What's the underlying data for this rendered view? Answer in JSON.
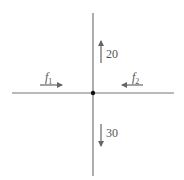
{
  "diagram": {
    "colors": {
      "line": "#777777",
      "arrow": "#666666",
      "dot": "#111111",
      "text": "#555555"
    },
    "forces": {
      "up": {
        "label": "20",
        "direction": "up"
      },
      "down": {
        "label": "30",
        "direction": "down"
      },
      "left_force": {
        "label": "f",
        "subscript": "1",
        "direction": "right"
      },
      "right_force": {
        "label": "f",
        "subscript": "2",
        "direction": "left"
      }
    }
  }
}
